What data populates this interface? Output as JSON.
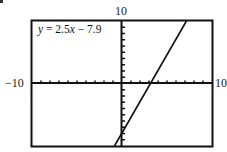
{
  "chart_data": {
    "type": "line",
    "title": "",
    "equation_label": "y = 2.5x − 7.9",
    "series": [
      {
        "name": "y = 2.5x − 7.9",
        "slope": 2.5,
        "intercept": -7.9,
        "x": [
          -0.84,
          7.16
        ],
        "y": [
          -10,
          10
        ]
      }
    ],
    "xlim": [
      -10,
      10
    ],
    "ylim": [
      -10,
      10
    ],
    "xscale": 1,
    "yscale": 1,
    "tick_labels": {
      "xmin": "−10",
      "xmax": "10",
      "ymax": "10"
    },
    "grid": false,
    "xlabel": "",
    "ylabel": ""
  },
  "labels": {
    "ymax": "10",
    "xmin": "−10",
    "xmax": "10",
    "equation_prefix": "y",
    "equation_mid": " = 2.5",
    "equation_var": "x",
    "equation_suffix": " − 7.9"
  },
  "colors": {
    "frame": "#111111",
    "line": "#111111",
    "background": "#ffffff"
  }
}
